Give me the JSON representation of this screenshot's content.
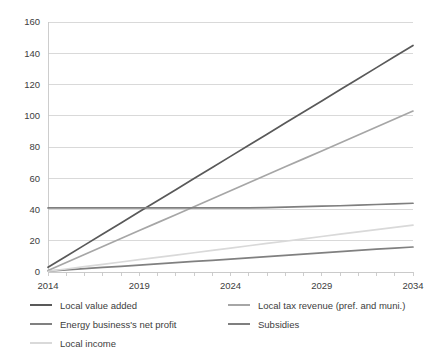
{
  "chart_data": {
    "type": "line",
    "title": "",
    "xlabel": "",
    "ylabel": "",
    "xlim": [
      2014,
      2034
    ],
    "ylim": [
      0,
      160
    ],
    "ytick_step": 20,
    "grid": true,
    "legend_position": "bottom",
    "x": [
      2014,
      2015,
      2016,
      2017,
      2018,
      2019,
      2020,
      2021,
      2022,
      2023,
      2024,
      2025,
      2026,
      2027,
      2028,
      2029,
      2030,
      2031,
      2032,
      2033,
      2034
    ],
    "xticks": [
      "2014",
      "2019",
      "2024",
      "2029",
      "2034"
    ],
    "yticks": [
      "0",
      "20",
      "40",
      "60",
      "80",
      "100",
      "120",
      "140",
      "160"
    ],
    "series": [
      {
        "name": "Local value added",
        "color": "#595959",
        "values": [
          3,
          10.1,
          17.2,
          24.3,
          31.4,
          38.5,
          45.6,
          52.7,
          59.8,
          66.9,
          74,
          81.1,
          88.2,
          95.3,
          102.4,
          109.5,
          116.6,
          123.7,
          130.8,
          137.9,
          145
        ]
      },
      {
        "name": "Local tax revenue (pref. and muni.)",
        "color": "#a6a6a6",
        "values": [
          1,
          6.1,
          11.2,
          16.3,
          21.4,
          26.5,
          31.6,
          36.7,
          41.8,
          46.9,
          52,
          57.1,
          62.2,
          67.3,
          72.4,
          77.5,
          82.6,
          87.7,
          92.8,
          97.9,
          103
        ]
      },
      {
        "name": "Energy business's net profit",
        "color": "#808080",
        "values": [
          0.5,
          1.3,
          2.1,
          2.9,
          3.6,
          4.4,
          5.2,
          6,
          6.8,
          7.5,
          8.3,
          9.1,
          9.9,
          10.7,
          11.4,
          12.2,
          13,
          13.8,
          14.6,
          15.3,
          16
        ]
      },
      {
        "name": "Subsidies",
        "color": "#7f7f7f",
        "values": [
          41,
          41,
          41,
          41,
          41,
          41,
          41,
          41,
          41,
          41,
          41,
          41,
          41.2,
          41.5,
          41.8,
          42.1,
          42.4,
          42.8,
          43.2,
          43.6,
          44
        ]
      },
      {
        "name": "Local income",
        "color": "#d9d9d9",
        "values": [
          0.5,
          1.9,
          3.4,
          4.9,
          6.4,
          7.9,
          9.4,
          10.8,
          12.3,
          13.8,
          15.3,
          16.8,
          18.3,
          19.7,
          21.2,
          22.7,
          24.2,
          25.7,
          27.1,
          28.6,
          30
        ]
      }
    ]
  },
  "legend": {
    "columns": [
      {
        "items": [
          {
            "label": "Local value added",
            "color": "#595959"
          },
          {
            "label": "Energy business's net profit",
            "color": "#808080"
          },
          {
            "label": "Local income",
            "color": "#d9d9d9"
          }
        ]
      },
      {
        "items": [
          {
            "label": "Local tax revenue (pref. and muni.)",
            "color": "#a6a6a6"
          },
          {
            "label": "Subsidies",
            "color": "#7f7f7f"
          }
        ]
      }
    ]
  }
}
